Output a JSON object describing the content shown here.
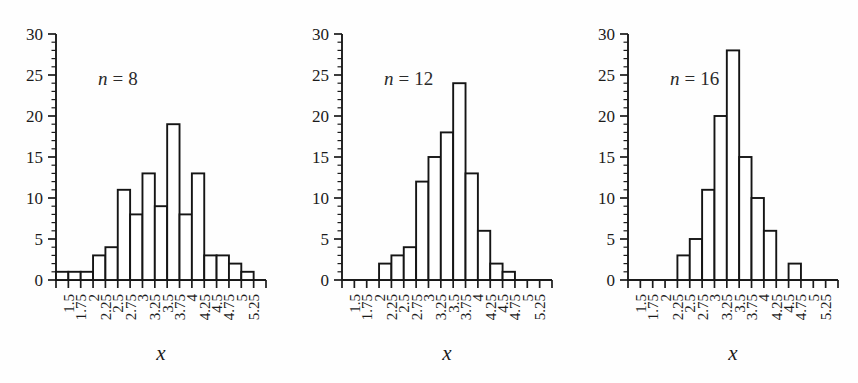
{
  "figure": {
    "background": "#fefefe",
    "line_color": "#151515",
    "bar_fill": "#ffffff",
    "panel_count": 3
  },
  "chart_data": [
    {
      "type": "bar",
      "title": "n = 8",
      "label_var": "n",
      "label_eq": "=",
      "label_value": "8",
      "xlabel": "x",
      "ylabel": "",
      "xlim": [
        1.25,
        5.5
      ],
      "ylim": [
        0,
        30
      ],
      "bin_width": 0.25,
      "grid": false,
      "ytick_labels": [
        "0",
        "5",
        "10",
        "15",
        "20",
        "25",
        "30"
      ],
      "ytick_values": [
        0,
        5,
        10,
        15,
        20,
        25,
        30
      ],
      "ytick_minor_step": 1,
      "xtick_labels": [
        "1.5",
        "1.75",
        "2",
        "2.25",
        "2.5",
        "2.75",
        "3",
        "3.25",
        "3.5",
        "3.75",
        "4",
        "4.25",
        "4.5",
        "4.75",
        "5",
        "5.25"
      ],
      "xtick_values": [
        1.5,
        1.75,
        2,
        2.25,
        2.5,
        2.75,
        3,
        3.25,
        3.5,
        3.75,
        4,
        4.25,
        4.5,
        4.75,
        5,
        5.25
      ],
      "bin_left_edges": [
        1.25,
        1.5,
        1.75,
        2.0,
        2.25,
        2.5,
        2.75,
        3.0,
        3.25,
        3.5,
        3.75,
        4.0,
        4.25,
        4.5,
        4.75,
        5.0
      ],
      "values": [
        1,
        1,
        1,
        3,
        4,
        11,
        8,
        13,
        9,
        19,
        8,
        13,
        3,
        3,
        2,
        1
      ]
    },
    {
      "type": "bar",
      "title": "n = 12",
      "label_var": "n",
      "label_eq": "=",
      "label_value": "12",
      "xlabel": "x",
      "ylabel": "",
      "xlim": [
        1.25,
        5.5
      ],
      "ylim": [
        0,
        30
      ],
      "bin_width": 0.25,
      "grid": false,
      "ytick_labels": [
        "0",
        "5",
        "10",
        "15",
        "20",
        "25",
        "30"
      ],
      "ytick_values": [
        0,
        5,
        10,
        15,
        20,
        25,
        30
      ],
      "ytick_minor_step": 1,
      "xtick_labels": [
        "1.5",
        "1.75",
        "2",
        "2.25",
        "2.5",
        "2.75",
        "3",
        "3.25",
        "3.5",
        "3.75",
        "4",
        "4.25",
        "4.5",
        "4.75",
        "5",
        "5.25"
      ],
      "xtick_values": [
        1.5,
        1.75,
        2,
        2.25,
        2.5,
        2.75,
        3,
        3.25,
        3.5,
        3.75,
        4,
        4.25,
        4.5,
        4.75,
        5,
        5.25
      ],
      "bin_left_edges": [
        1.25,
        1.5,
        1.75,
        2.0,
        2.25,
        2.5,
        2.75,
        3.0,
        3.25,
        3.5,
        3.75,
        4.0,
        4.25,
        4.5,
        4.75,
        5.0
      ],
      "values": [
        0,
        0,
        0,
        2,
        3,
        4,
        12,
        15,
        18,
        24,
        13,
        6,
        2,
        1,
        0,
        0
      ]
    },
    {
      "type": "bar",
      "title": "n = 16",
      "label_var": "n",
      "label_eq": "=",
      "label_value": "16",
      "xlabel": "x",
      "ylabel": "",
      "xlim": [
        1.25,
        5.5
      ],
      "ylim": [
        0,
        30
      ],
      "bin_width": 0.25,
      "grid": false,
      "ytick_labels": [
        "0",
        "5",
        "10",
        "15",
        "20",
        "25",
        "30"
      ],
      "ytick_values": [
        0,
        5,
        10,
        15,
        20,
        25,
        30
      ],
      "ytick_minor_step": 1,
      "xtick_labels": [
        "1.5",
        "1.75",
        "2",
        "2.25",
        "2.5",
        "2.75",
        "3",
        "3.25",
        "3.5",
        "3.75",
        "4",
        "4.25",
        "4.5",
        "4.75",
        "5",
        "5.25"
      ],
      "xtick_values": [
        1.5,
        1.75,
        2,
        2.25,
        2.5,
        2.75,
        3,
        3.25,
        3.5,
        3.75,
        4,
        4.25,
        4.5,
        4.75,
        5,
        5.25
      ],
      "bin_left_edges": [
        1.25,
        1.5,
        1.75,
        2.0,
        2.25,
        2.5,
        2.75,
        3.0,
        3.25,
        3.5,
        3.75,
        4.0,
        4.25,
        4.5,
        4.75,
        5.0
      ],
      "values": [
        0,
        0,
        0,
        0,
        3,
        5,
        11,
        20,
        28,
        15,
        10,
        6,
        0,
        2,
        0,
        0
      ]
    }
  ]
}
